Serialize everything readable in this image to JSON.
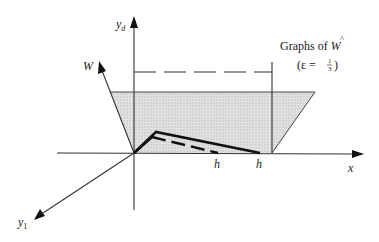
{
  "diagram": {
    "axes": {
      "yd_label": "y",
      "yd_subscript": "d",
      "w_label": "W",
      "x_label": "x",
      "y1_label": "y",
      "y1_subscript": "1"
    },
    "tick_labels": {
      "h_inner": "h",
      "h_outer": "h"
    },
    "caption": {
      "line1_prefix": "Graphs of ",
      "line1_symbol": "W",
      "line1_hat": "^",
      "line2_open": "(ε = ",
      "frac_num": "1",
      "frac_den": "3",
      "line2_close": ")"
    },
    "colors": {
      "line": "#2a2a2a",
      "shade": "#d8d8d8",
      "bold_graph": "#111111"
    }
  }
}
